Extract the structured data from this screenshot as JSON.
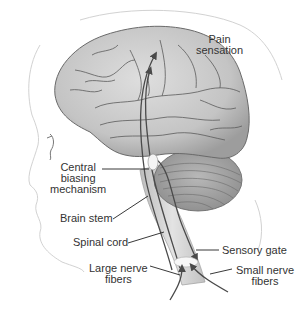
{
  "diagram": {
    "labels": {
      "pain_sensation": [
        "Pain",
        "sensation"
      ],
      "central_biasing": [
        "Central",
        "biasing",
        "mechanism"
      ],
      "brain_stem": "Brain stem",
      "spinal_cord": "Spinal cord",
      "sensory_gate": "Sensory gate",
      "large_nerve_fibers": [
        "Large nerve",
        "fibers"
      ],
      "small_nerve_fibers": [
        "Small nerve",
        "fibers"
      ]
    },
    "colors": {
      "brain_fill": "#c9c9c9",
      "brain_shadow": "#9a9a9a",
      "sulci": "#5a5a5a",
      "cerebellum_fill": "#a8a8a8",
      "spinal_cord": "#d4d4d4",
      "pathway": "#4a4a4a",
      "leader_line": "#222222",
      "label_text": "#333333",
      "face_outline": "#cfcfcf"
    }
  }
}
